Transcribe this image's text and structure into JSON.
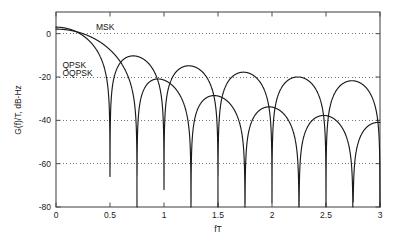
{
  "chart_data": {
    "type": "line",
    "title": "",
    "subtitle": "",
    "xlabel": "fT",
    "ylabel": "G(f)/T, dB-Hz",
    "xlim": [
      0,
      3
    ],
    "ylim": [
      -80,
      0
    ],
    "y_axis_top_value": 10,
    "grid": true,
    "grid_style": "dotted-horizontal",
    "legend_position": "in-plot-annotations",
    "xticks": [
      0,
      0.5,
      1,
      1.5,
      2,
      2.5,
      3
    ],
    "xticklabels": [
      "0",
      "0.5",
      "1",
      "1.5",
      "2",
      "2.5",
      "3"
    ],
    "yticks": [
      0,
      -20,
      -40,
      -60,
      -80
    ],
    "yticklabels": [
      "0",
      "-20",
      "-40",
      "-60",
      "-80"
    ],
    "annotations": [
      {
        "text": "MSK",
        "x": 0.37,
        "y": 1.5
      },
      {
        "text": "QPSK",
        "x": 0.06,
        "y": -16.0
      },
      {
        "text": "OQPSK",
        "x": 0.06,
        "y": -19.5
      }
    ],
    "series": [
      {
        "name": "MSK",
        "label": "MSK",
        "color": "#1a1a1a",
        "peak_db": 3.0,
        "nulls": [
          0.75,
          1.25,
          1.75,
          2.25,
          2.75
        ],
        "sidelobe_peaks_db": [
          -10.3,
          -14.6,
          -17.4,
          -19.4,
          -21.0
        ],
        "sidelobe_peak_positions": [
          1.0,
          1.5,
          2.0,
          2.5,
          3.0
        ],
        "formula": "10*log10( (16/pi^2) * (cos(2*pi*f*T)/(1-16*f^2*T^2))^2 )"
      },
      {
        "name": "QPSK/OQPSK",
        "label": "QPSK OQPSK",
        "color": "#1a1a1a",
        "peak_db": 3.0,
        "nulls": [
          0.5,
          1.0,
          1.5,
          2.0,
          2.5,
          3.0
        ],
        "sidelobe_peaks_db": [
          -10.2,
          -20.2,
          -28.2,
          -34.0,
          -38.3
        ],
        "sidelobe_peak_positions": [
          0.72,
          1.22,
          1.72,
          2.22,
          2.72
        ],
        "formula": "10*log10( 2 * (sin(2*pi*f*T)/(2*pi*f*T))^2 )"
      }
    ]
  },
  "axes": {
    "frame_color": "#4d4d4d",
    "grid_color": "#555555",
    "tick_color": "#4d4d4d"
  }
}
